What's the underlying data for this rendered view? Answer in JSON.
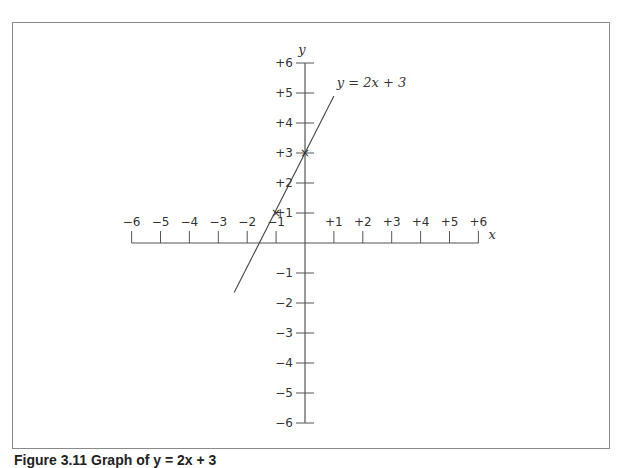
{
  "caption": "Figure 3.11 Graph of y = 2x + 3",
  "chart_data": {
    "type": "line",
    "title": "",
    "xlabel": "x",
    "ylabel": "y",
    "xlim": [
      -6,
      6
    ],
    "ylim": [
      -6,
      6
    ],
    "x_ticks": [
      "−6",
      "−5",
      "−4",
      "−3",
      "−2",
      "−1",
      "+1",
      "+2",
      "+3",
      "+4",
      "+5",
      "+6"
    ],
    "y_ticks": [
      "+6",
      "+5",
      "+4",
      "+3",
      "+2",
      "+1",
      "−1",
      "−2",
      "−3",
      "−4",
      "−5",
      "−6"
    ],
    "grid": false,
    "series": [
      {
        "name": "y = 2x + 3",
        "x": [
          -2.45,
          1.0
        ],
        "y": [
          -1.65,
          4.9
        ]
      }
    ],
    "marked_points": [
      {
        "x": -1,
        "y": 1,
        "marker": "x"
      },
      {
        "x": 0,
        "y": 3,
        "marker": "x"
      }
    ],
    "annotations": [
      {
        "text": "y = 2x + 3",
        "near": [
          1.1,
          5.3
        ]
      }
    ]
  },
  "colors": {
    "line": "#444444",
    "axis": "#555555",
    "frame": "#8a8a8a"
  }
}
